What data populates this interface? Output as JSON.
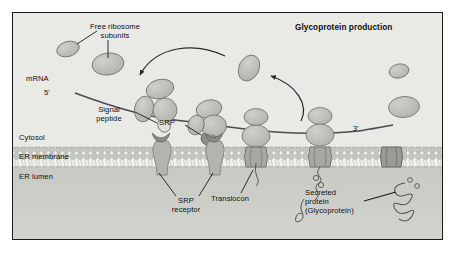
{
  "figure": {
    "title": "Glycoprotein production",
    "type": "biology-diagram"
  },
  "compartments": [
    {
      "id": "cytosol",
      "label": "Cytosol",
      "color": "#e9e9e6"
    },
    {
      "id": "er-membrane",
      "label": "ER membrane",
      "color": "#d9d9d4"
    },
    {
      "id": "er-lumen",
      "label": "ER lumen",
      "color": "#cfcfca"
    }
  ],
  "labels": {
    "free_ribosome": "Free ribosome\nsubunits",
    "mrna": "mRNA",
    "five_prime": "5'",
    "three_prime": "3'",
    "signal_peptide": "Signal\npeptide",
    "srp": "SRP",
    "srp_receptor": "SRP\nreceptor",
    "translocon": "Translocon",
    "secreted_protein": "Secreted\nprotein\n(Glycoprotein)"
  },
  "colors": {
    "outline": "#1a1a1a",
    "cytosol_bg": "#e9e9e6",
    "membrane_bg": "#d9d9d4",
    "lumen_bg": "#cfcfca",
    "ribosome_fill": "#bdbdb8",
    "ribosome_stroke": "#6e6e6a",
    "srp_dark": "#8d8d88",
    "translocon_fill": "#a8a8a3",
    "translocon_dark": "#7a7a76",
    "lipid_head": "#c6c6c1",
    "lipid_tail": "#f2f2ef",
    "chain_stroke": "#55555a",
    "arrow_stroke": "#2a2a2a"
  },
  "structures": {
    "free_subunits_left": 2,
    "free_subunits_right": 2,
    "membrane_bound_ribosomes": 3,
    "srp_receptors": 2,
    "translocons": 3,
    "nascent_chains": 3
  }
}
